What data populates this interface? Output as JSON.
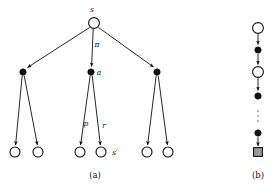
{
  "figure": {
    "panels": [
      {
        "id": "a",
        "caption": "(a)",
        "caption_x": 95,
        "caption_y": 176
      },
      {
        "id": "b",
        "caption": "(b)",
        "caption_y": 176,
        "caption_x": 258
      }
    ],
    "labels": {
      "state_root": "s",
      "policy": "π",
      "action": "a",
      "probability": "p",
      "reward": "r",
      "next_state": "s′"
    },
    "colors": {
      "stroke": "#111111",
      "node_open_fill": "#ffffff",
      "node_filled_fill": "#111111",
      "terminal_fill": "#9a9a9a",
      "background": "#ffffff"
    },
    "panel_a": {
      "root": {
        "name": "state-node-root",
        "x": 94,
        "y": 23,
        "r": 5.4,
        "kind": "open",
        "label": "s",
        "label_x": 92,
        "label_y": 11
      },
      "action_nodes": [
        {
          "name": "action-node-left",
          "x": 23,
          "y": 72,
          "r": 3.1,
          "kind": "filled",
          "label": "",
          "label_x": 0,
          "label_y": 0
        },
        {
          "name": "action-node-center",
          "x": 91,
          "y": 72,
          "r": 3.1,
          "kind": "filled",
          "label": "a",
          "label_x": 97,
          "label_y": 74
        },
        {
          "name": "action-node-right",
          "x": 157,
          "y": 72,
          "r": 3.1,
          "kind": "filled",
          "label": "",
          "label_x": 0,
          "label_y": 0
        }
      ],
      "leaf_nodes": [
        {
          "name": "state-node-leaf-1",
          "x": 15,
          "y": 152,
          "r": 5.0,
          "kind": "open"
        },
        {
          "name": "state-node-leaf-2",
          "x": 38,
          "y": 152,
          "r": 5.0,
          "kind": "open"
        },
        {
          "name": "state-node-leaf-3",
          "x": 80,
          "y": 152,
          "r": 5.0,
          "kind": "open"
        },
        {
          "name": "state-node-leaf-4",
          "x": 101,
          "y": 152,
          "r": 5.0,
          "kind": "open"
        },
        {
          "name": "state-node-leaf-5",
          "x": 147,
          "y": 152,
          "r": 5.0,
          "kind": "open"
        },
        {
          "name": "state-node-leaf-6",
          "x": 168,
          "y": 152,
          "r": 5.0,
          "kind": "open"
        }
      ],
      "edge_labels": [
        {
          "name": "edge-label-policy",
          "text": "π",
          "x": 96,
          "y": 46
        },
        {
          "name": "edge-label-probability",
          "text": "p",
          "x": 87,
          "y": 124
        },
        {
          "name": "edge-label-reward",
          "text": "r",
          "x": 104,
          "y": 126
        },
        {
          "name": "edge-label-next-state",
          "text": "s′",
          "x": 113,
          "y": 153
        }
      ]
    },
    "panel_b": {
      "chain": [
        {
          "name": "state-node-b1",
          "x": 258,
          "y": 28,
          "r": 5.4,
          "kind": "open"
        },
        {
          "name": "action-node-b2",
          "x": 258,
          "y": 50,
          "r": 3.1,
          "kind": "filled"
        },
        {
          "name": "state-node-b3",
          "x": 258,
          "y": 72,
          "r": 5.4,
          "kind": "open"
        },
        {
          "name": "action-node-b4",
          "x": 258,
          "y": 96,
          "r": 3.1,
          "kind": "filled"
        },
        {
          "name": "action-node-b5",
          "x": 258,
          "y": 133,
          "r": 3.1,
          "kind": "filled"
        },
        {
          "name": "terminal-node-b6",
          "x": 258,
          "y": 152,
          "r": 4.4,
          "kind": "terminal"
        }
      ],
      "ellipsis": {
        "name": "vertical-ellipsis",
        "x": 258,
        "dots_y": [
          110,
          115,
          120
        ]
      }
    }
  }
}
